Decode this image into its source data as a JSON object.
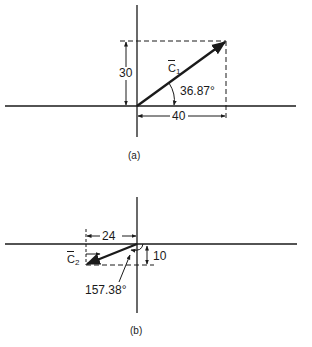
{
  "figure_a": {
    "caption": "(a)",
    "vector_symbol": "C",
    "vector_subscript": "1",
    "vertical_dimension": "30",
    "horizontal_dimension": "40",
    "angle": "36.87°"
  },
  "figure_b": {
    "caption": "(b)",
    "vector_symbol": "C",
    "vector_subscript": "2",
    "vertical_dimension": "10",
    "horizontal_dimension": "24",
    "angle": "157.38°"
  },
  "colors": {
    "ink": "#1a1a1a",
    "background": "#ffffff"
  }
}
